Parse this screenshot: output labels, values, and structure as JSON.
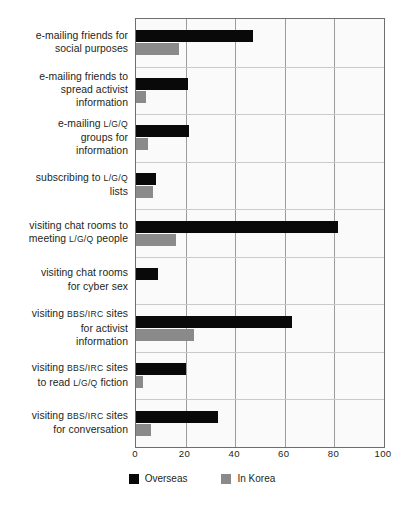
{
  "chart_data": {
    "type": "bar",
    "orientation": "horizontal",
    "title": "",
    "xlabel": "",
    "ylabel": "",
    "xlim": [
      0,
      100
    ],
    "xticks": [
      0,
      20,
      40,
      60,
      80,
      100
    ],
    "grid": true,
    "legend_position": "bottom-center",
    "categories": [
      "e-mailing friends for social purposes",
      "e-mailing friends to spread activist information",
      "e-mailing L/G/Q groups for information",
      "subscribing to L/G/Q lists",
      "visiting chat rooms to meeting L/G/Q people",
      "visiting chat rooms for cyber sex",
      "visiting BBS/IRC sites for activist information",
      "visiting BBS/IRC sites to read L/G/Q fiction",
      "visiting BBS/IRC sites for conversation"
    ],
    "category_lines": [
      [
        "e-mailing friends for",
        "social purposes"
      ],
      [
        "e-mailing friends to",
        "spread activist",
        "information"
      ],
      [
        "e-mailing L/G/Q",
        "groups for",
        "information"
      ],
      [
        "subscribing to L/G/Q",
        "lists"
      ],
      [
        "visiting chat rooms to",
        "meeting L/G/Q people"
      ],
      [
        "visiting chat rooms",
        "for cyber sex"
      ],
      [
        "visiting BBS/IRC sites",
        "for activist",
        "information"
      ],
      [
        "visiting BBS/IRC sites",
        "to read L/G/Q fiction"
      ],
      [
        "visiting BBS/IRC sites",
        "for conversation"
      ]
    ],
    "series": [
      {
        "name": "Overseas",
        "color": "#090909",
        "values": [
          47,
          21,
          21.5,
          8,
          81.5,
          9,
          63,
          20,
          33
        ]
      },
      {
        "name": "In Korea",
        "color": "#8a8a8a",
        "values": [
          17.5,
          4,
          5,
          7,
          16,
          0,
          23.5,
          3,
          6
        ]
      }
    ]
  },
  "legend": {
    "items": [
      {
        "label": "Overseas",
        "color": "#090909"
      },
      {
        "label": "In Korea",
        "color": "#8a8a8a"
      }
    ]
  }
}
